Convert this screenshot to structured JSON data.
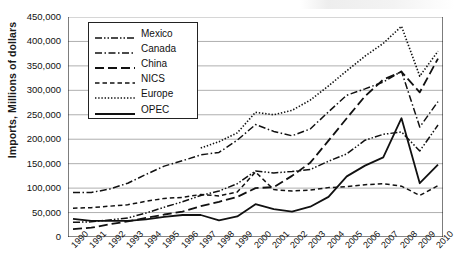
{
  "chart_data": {
    "type": "line",
    "title": "",
    "xlabel": "",
    "ylabel": "Imports, Millions of dollars",
    "x": [
      1990,
      1991,
      1992,
      1993,
      1994,
      1995,
      1996,
      1997,
      1998,
      1999,
      2000,
      2001,
      2002,
      2003,
      2004,
      2005,
      2006,
      2007,
      2008,
      2009,
      2010
    ],
    "xtick_labels": [
      "1990",
      "1991",
      "1992",
      "1993",
      "1994",
      "1995",
      "1996",
      "1997",
      "1998",
      "1999",
      "2000",
      "2001",
      "2002",
      "2003",
      "2004",
      "2005",
      "2006",
      "2007",
      "2008",
      "2009",
      "2010"
    ],
    "ytick_labels": [
      "0",
      "50,000",
      "100,000",
      "150,000",
      "200,000",
      "250,000",
      "300,000",
      "350,000",
      "400,000",
      "450,000"
    ],
    "ylim": [
      0,
      450000
    ],
    "ytick_step": 50000,
    "grid": true,
    "legend_position": "upper-left-inside",
    "series": [
      {
        "name": "Mexico",
        "dash": "mexico",
        "values": [
          30000,
          31000,
          35000,
          39000,
          49000,
          61000,
          72000,
          85000,
          94000,
          109000,
          135000,
          131000,
          134000,
          138000,
          155000,
          170000,
          198000,
          210000,
          215000,
          176000,
          229000
        ]
      },
      {
        "name": "Canada",
        "dash": "canada",
        "values": [
          91000,
          91000,
          98000,
          110000,
          128000,
          145000,
          156000,
          168000,
          173000,
          198000,
          230000,
          216000,
          207000,
          221000,
          256000,
          290000,
          303000,
          317000,
          339000,
          225000,
          277000
        ]
      },
      {
        "name": "China",
        "dash": "china",
        "values": [
          16000,
          19000,
          26000,
          32000,
          39000,
          46000,
          52000,
          63000,
          72000,
          82000,
          100000,
          102000,
          125000,
          152000,
          197000,
          243000,
          288000,
          322000,
          338000,
          296000,
          365000
        ]
      },
      {
        "name": "NICS",
        "dash": "nics",
        "values": [
          59000,
          60000,
          63000,
          66000,
          73000,
          79000,
          81000,
          87000,
          84000,
          92000,
          133000,
          97000,
          94000,
          96000,
          101000,
          103000,
          107000,
          109000,
          104000,
          85000,
          105000
        ]
      },
      {
        "name": "Europe",
        "dash": "europe",
        "values": [
          null,
          null,
          null,
          null,
          null,
          null,
          null,
          182000,
          195000,
          213000,
          255000,
          250000,
          259000,
          280000,
          309000,
          340000,
          370000,
          396000,
          431000,
          329000,
          380000
        ]
      },
      {
        "name": "OPEC",
        "dash": "opec",
        "values": [
          37000,
          33000,
          33000,
          33000,
          36000,
          41000,
          45000,
          45000,
          34000,
          42000,
          67000,
          57000,
          52000,
          62000,
          82000,
          124000,
          146000,
          163000,
          243000,
          110000,
          148000
        ]
      }
    ]
  },
  "legend": {
    "items": [
      {
        "label": "Mexico"
      },
      {
        "label": "Canada"
      },
      {
        "label": "China"
      },
      {
        "label": "NICS"
      },
      {
        "label": "Europe"
      },
      {
        "label": "OPEC"
      }
    ]
  }
}
